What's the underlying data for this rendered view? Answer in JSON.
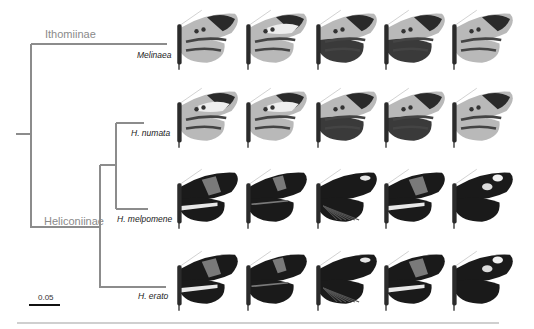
{
  "clades": [
    {
      "name": "Ithomiinae"
    },
    {
      "name": "Heliconiinae"
    }
  ],
  "taxa": [
    {
      "label": "Melinaea"
    },
    {
      "label": "H. numata"
    },
    {
      "label": "H. melpomene"
    },
    {
      "label": "H. erato"
    }
  ],
  "scale_bar": {
    "label": "0.05"
  },
  "rows": [
    {
      "taxon": "Melinaea",
      "specimens": [
        "tiger-striped",
        "tiger-spotted",
        "tiger-dark",
        "tiger-dark-spot",
        "tiger-striped-light"
      ]
    },
    {
      "taxon": "H. numata",
      "specimens": [
        "tiger-light",
        "tiger-spotted",
        "tiger-dark",
        "tiger-dark-spot",
        "tiger-striped-light"
      ]
    },
    {
      "taxon": "H. melpomene",
      "specimens": [
        "postman-red-band",
        "postman-rayed",
        "rayed-white-spot",
        "postman-red-band",
        "white-spots"
      ]
    },
    {
      "taxon": "H. erato",
      "specimens": [
        "postman-red-band",
        "postman-rayed",
        "rayed-white-spot",
        "postman-red-band",
        "white-spots"
      ]
    }
  ],
  "colors": {
    "branch": "#8c8c8c",
    "wing_dark": "#1a1a1a",
    "wing_light": "#b9b9b9",
    "band": "#7a7a7a"
  }
}
